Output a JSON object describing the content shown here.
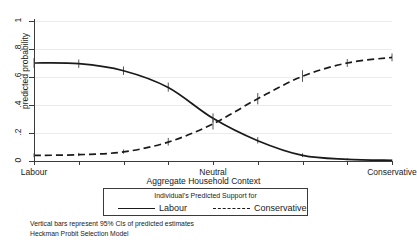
{
  "chart_data": {
    "type": "line",
    "title": "",
    "xlabel": "Aggregate Household Context",
    "ylabel": "predicted probability",
    "ylim": [
      0,
      1
    ],
    "xlim": [
      0,
      8
    ],
    "grid": true,
    "legend_position": "below-axis",
    "legend_title": "Individual's Predicted Support for",
    "y_ticks": [
      "0",
      ".2",
      ".4",
      ".6",
      ".8",
      "1"
    ],
    "y_tick_values": [
      0,
      0.2,
      0.4,
      0.6,
      0.8,
      1
    ],
    "x_tick_values": [
      0,
      1,
      2,
      3,
      4,
      5,
      6,
      7,
      8
    ],
    "x_tick_labels": [
      "Labour",
      "",
      "",
      "",
      "Neutral",
      "",
      "",
      "",
      "Conservative"
    ],
    "x": [
      0,
      1,
      2,
      3,
      4,
      5,
      6,
      7,
      8
    ],
    "series": [
      {
        "name": "Labour",
        "style": "solid",
        "color": "#1a1a1a",
        "values": [
          0.7,
          0.695,
          0.645,
          0.525,
          0.305,
          0.145,
          0.04,
          0.012,
          0.005
        ],
        "ci_low": [
          0.665,
          0.665,
          0.615,
          0.495,
          0.275,
          0.125,
          0.028,
          0.006,
          0.002
        ],
        "ci_high": [
          0.735,
          0.725,
          0.675,
          0.56,
          0.34,
          0.17,
          0.055,
          0.02,
          0.01
        ]
      },
      {
        "name": "Conservative",
        "style": "dashed",
        "color": "#1a1a1a",
        "values": [
          0.04,
          0.045,
          0.065,
          0.135,
          0.265,
          0.445,
          0.605,
          0.7,
          0.74
        ],
        "ci_low": [
          0.028,
          0.035,
          0.052,
          0.11,
          0.225,
          0.405,
          0.565,
          0.672,
          0.712
        ],
        "ci_high": [
          0.055,
          0.058,
          0.082,
          0.165,
          0.305,
          0.485,
          0.648,
          0.728,
          0.768
        ]
      }
    ],
    "annotations": [
      "Vertical bars represent 95% CIs of predicted estimates",
      "Heckman Probit Selection Model"
    ]
  },
  "notes": {
    "line1": "Vertical bars represent 95% CIs of predicted estimates",
    "line2": "Heckman Probit Selection Model"
  },
  "legend": {
    "title": "Individual's Predicted Support for",
    "labour_label": "Labour",
    "conservative_label": "Conservative"
  },
  "axes": {
    "y_title": "predicted probability",
    "x_title": "Aggregate Household Context",
    "x_label_left": "Labour",
    "x_label_mid": "Neutral",
    "x_label_right": "Conservative"
  }
}
